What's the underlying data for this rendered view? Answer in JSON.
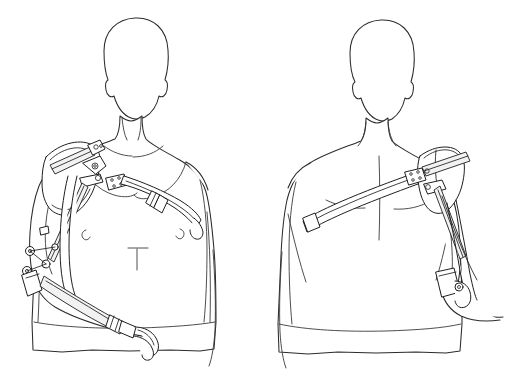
{
  "illustration": {
    "title": "Shoulder and arm orthosis harness — front and back views",
    "style": "black-and-white technical line drawing",
    "background_color": "#ffffff",
    "line_color": "#1f1f1f",
    "body_outline_color": "#2b2b2b",
    "shade_fill_color": "#f2f2f2",
    "canvas": {
      "width": 513,
      "height": 386
    },
    "text_labels": [],
    "views": [
      {
        "id": "front-view",
        "name": "Front view",
        "position": "left",
        "subject": "male torso, front facing, featureless head",
        "device_side": "subject right arm (viewer left)",
        "components": [
          "shoulder-cap-bracket",
          "upper-arm-strut",
          "elbow-joint-hinge",
          "forearm-strut",
          "terminal-hook-device",
          "chest-strap",
          "strap-buckle",
          "shoulder-anchor-plate",
          "rivet-cluster"
        ],
        "body_details": [
          "collarbone-contours",
          "pectoral-contours",
          "nipple-marks",
          "navel-mark",
          "waist-edge"
        ]
      },
      {
        "id": "back-view",
        "name": "Back view",
        "position": "right",
        "subject": "male torso, rear facing, featureless head",
        "device_side": "subject right arm (viewer right)",
        "components": [
          "shoulder-cap-bracket",
          "upper-arm-strut",
          "diagonal-back-strap",
          "strap-end-tab",
          "anchor-plate",
          "elbow-cuff",
          "tension-cable"
        ],
        "body_details": [
          "spine-line",
          "scapula-contours",
          "latissimus-contours",
          "shirt-hem-edge"
        ]
      }
    ]
  }
}
